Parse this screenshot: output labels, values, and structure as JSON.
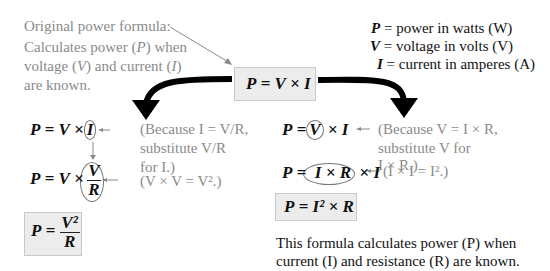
{
  "intro": {
    "line1": "Original power formula:",
    "line2a": "Calculates power (",
    "line2v": "P",
    "line2b": ") when",
    "line3a": "voltage (",
    "line3v": "V",
    "line3b": ") and current (",
    "line3c": "I",
    "line3d": ")",
    "line4": "are known."
  },
  "legend": [
    {
      "sym": "P",
      "text": "= power in watts (W)"
    },
    {
      "sym": "V",
      "text": "= voltage in volts (V)"
    },
    {
      "sym": "I",
      "text": "= current in amperes (A)"
    }
  ],
  "main_formula": {
    "lhs": "P",
    "eq": "=",
    "a": "V",
    "op": "×",
    "b": "I"
  },
  "left": {
    "step1": {
      "lhs": "P",
      "eq": "=",
      "a": "V",
      "op": "×",
      "circled": "I",
      "note1": "(Because I = V/R,",
      "note2": "substitute V/R",
      "note3": "for I.)"
    },
    "step2": {
      "lhs": "P",
      "eq": "=",
      "a": "V",
      "op": "×",
      "num": "V",
      "den": "R",
      "note": "(V × V = V².)"
    },
    "result": {
      "lhs": "P",
      "eq": "=",
      "num": "V²",
      "den": "R"
    }
  },
  "right": {
    "step1": {
      "lhs": "P",
      "eq": "=",
      "circled": "V",
      "op": "×",
      "b": "I",
      "note1": "(Because V = I × R,",
      "note2": "substitute V for",
      "note3": "I × R.)"
    },
    "step2": {
      "lhs": "P",
      "eq": "=",
      "circled": "I × R",
      "op": "×",
      "b": "I",
      "note": "(I × I = I².)"
    },
    "result": {
      "lhs": "P",
      "eq": "=",
      "expr": "I² × R"
    },
    "caption1": "This formula calculates power (P) when",
    "caption2": "current (I) and resistance (R) are known."
  },
  "colors": {
    "note_gray": "#8a8a8a",
    "box_fill": "#ececec",
    "arrow": "#000000"
  }
}
